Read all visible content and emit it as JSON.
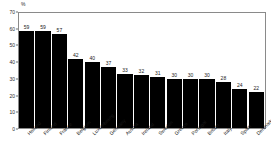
{
  "chart_data": {
    "type": "bar",
    "title": "",
    "subtitle": "",
    "xlabel": "",
    "ylabel": "%",
    "unit_label": "%",
    "ylim": [
      0,
      70
    ],
    "ytick_values": [
      0,
      10,
      20,
      30,
      40,
      50,
      60,
      70
    ],
    "ytick_labels": [
      "0",
      "10",
      "20",
      "30",
      "40",
      "50",
      "60",
      "70"
    ],
    "grid": false,
    "legend": null,
    "bar_color": "#000000",
    "frame_color": "#8a8a8a",
    "categories": [
      "Holland",
      "Finland",
      "France",
      "Belgium",
      "Luxembourg",
      "Germany",
      "Austria",
      "Ireland",
      "Sweden",
      "Greece",
      "Portugal",
      "Britain",
      "Italy",
      "Spain",
      "Denmark"
    ],
    "values": [
      59,
      59,
      57,
      42,
      40,
      37,
      33,
      32,
      31,
      30,
      30,
      30,
      28,
      24,
      22
    ],
    "value_labels": [
      "59",
      "59",
      "57",
      "42",
      "40",
      "37",
      "33",
      "32",
      "31",
      "30",
      "30",
      "30",
      "28",
      "24",
      "22"
    ]
  }
}
